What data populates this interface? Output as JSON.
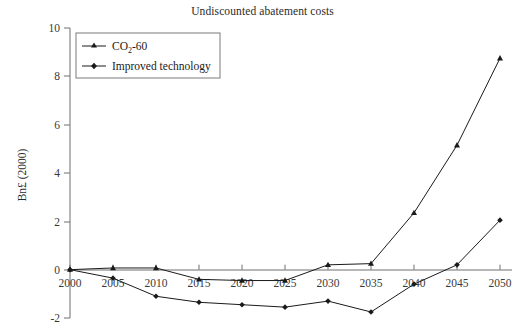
{
  "chart_data": {
    "type": "line",
    "title": "Undiscounted abatement costs",
    "xlabel": "",
    "ylabel": "Bn£ (2000)",
    "x": [
      2000,
      2005,
      2010,
      2015,
      2020,
      2025,
      2030,
      2035,
      2040,
      2045,
      2050
    ],
    "xtick_labels": [
      "2000",
      "2005",
      "2010",
      "2015",
      "2020",
      "2025",
      "2030",
      "2035",
      "2040",
      "2045",
      "2050"
    ],
    "ytick_labels": [
      "-2",
      "0",
      "2",
      "4",
      "6",
      "8",
      "10"
    ],
    "ytick_values": [
      -2,
      0,
      2,
      4,
      6,
      8,
      10
    ],
    "xlim": [
      2000,
      2050
    ],
    "ylim": [
      -2,
      10
    ],
    "grid": false,
    "legend_position": "top-left",
    "series": [
      {
        "name": "CO2-60",
        "label_main": "CO",
        "label_sub": "2",
        "label_tail": "-60",
        "marker": "triangle",
        "values": [
          0.0,
          0.07,
          0.07,
          -0.4,
          -0.45,
          -0.45,
          0.2,
          0.25,
          2.35,
          5.15,
          8.75
        ]
      },
      {
        "name": "Improved technology",
        "label_main": "Improved technology",
        "marker": "diamond",
        "values": [
          0.0,
          -0.35,
          -1.1,
          -1.35,
          -1.45,
          -1.55,
          -1.3,
          -1.75,
          -0.6,
          0.2,
          2.05
        ]
      }
    ]
  },
  "axes": {
    "y_title": "Bn£ (2000)"
  }
}
